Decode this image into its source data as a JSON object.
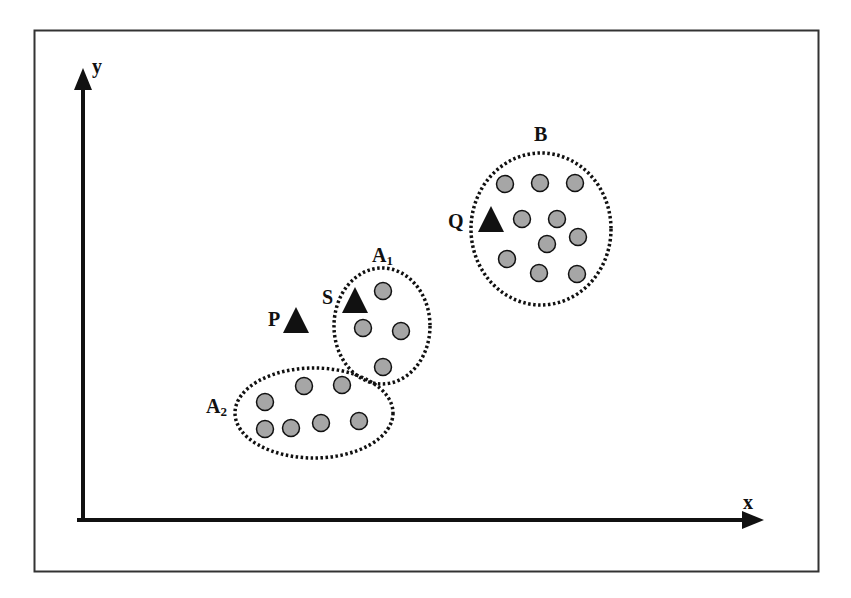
{
  "diagram": {
    "axes": {
      "x_label": "x",
      "y_label": "y"
    },
    "colors": {
      "point_fill": "#a6a6a6",
      "stroke": "#111111",
      "triangle": "#111111",
      "frame": "#333333"
    },
    "clusters": [
      {
        "id": "B",
        "label": "B",
        "cx": 541,
        "cy": 229,
        "rx": 70,
        "ry": 76,
        "points": [
          [
            505,
            184
          ],
          [
            540,
            183
          ],
          [
            575,
            183
          ],
          [
            522,
            219
          ],
          [
            557,
            219
          ],
          [
            547,
            244
          ],
          [
            578,
            237
          ],
          [
            507,
            259
          ],
          [
            539,
            273
          ],
          [
            577,
            274
          ]
        ]
      },
      {
        "id": "A1",
        "label": "A",
        "sub": "1",
        "cx": 382,
        "cy": 326,
        "rx": 48,
        "ry": 58,
        "points": [
          [
            383,
            291
          ],
          [
            363,
            328
          ],
          [
            401,
            331
          ],
          [
            383,
            367
          ]
        ]
      },
      {
        "id": "A2",
        "label": "A",
        "sub": "2",
        "cx": 314,
        "cy": 413,
        "rx": 79,
        "ry": 45,
        "points": [
          [
            304,
            386
          ],
          [
            342,
            385
          ],
          [
            265,
            402
          ],
          [
            265,
            429
          ],
          [
            291,
            428
          ],
          [
            321,
            423
          ],
          [
            359,
            421
          ]
        ]
      }
    ],
    "triangles": [
      {
        "label": "P",
        "x": 296,
        "y": 320
      },
      {
        "label": "S",
        "x": 355,
        "y": 300
      },
      {
        "label": "Q",
        "x": 491,
        "y": 219
      }
    ]
  }
}
